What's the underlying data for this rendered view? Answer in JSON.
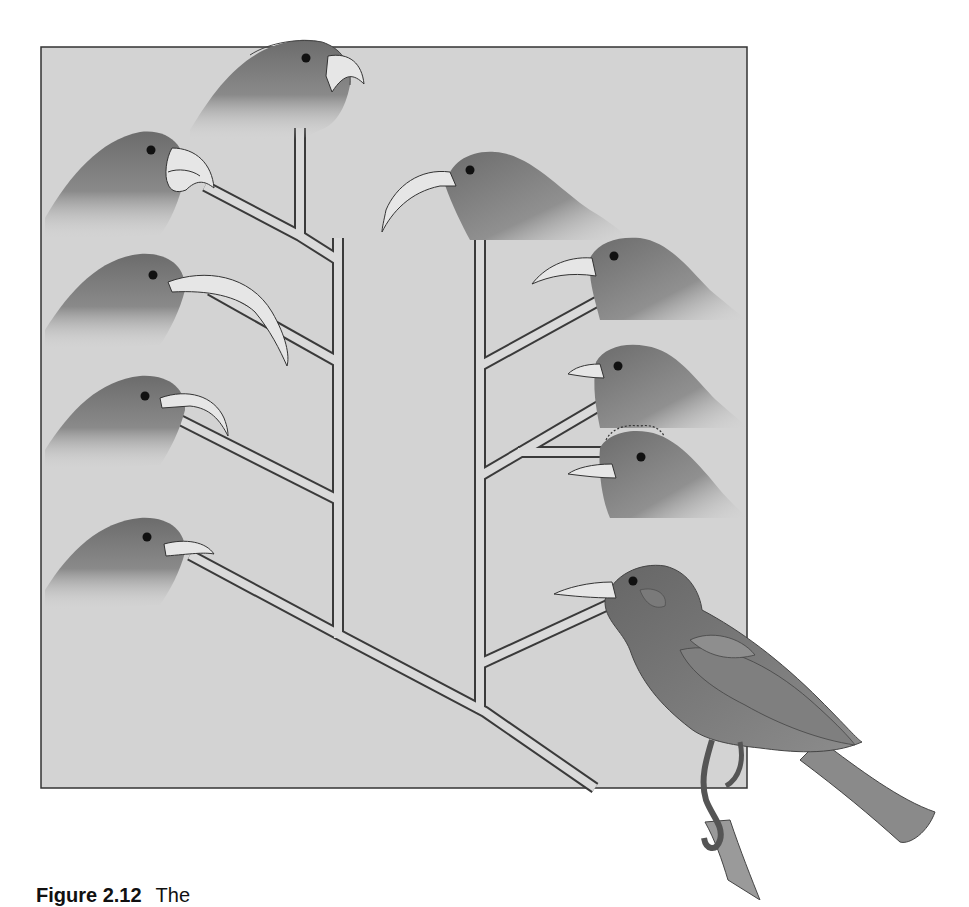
{
  "figure": {
    "colors": {
      "page_background": "#ffffff",
      "panel_background": "#d3d3d3",
      "panel_border": "#333333",
      "bird_body": "#6c6c6c",
      "bird_shade": "#555555",
      "beak": "#e6e6e6",
      "branch_fill": "#dadada",
      "branch_outline": "#3a3a3a"
    },
    "birds": [
      {
        "id": "top-center",
        "beak": "thick-hooked-finch-beak"
      },
      {
        "id": "left-1",
        "beak": "heavy-parrot-beak"
      },
      {
        "id": "left-2",
        "beak": "long-strongly-curved-beak"
      },
      {
        "id": "left-3",
        "beak": "medium-curved-beak"
      },
      {
        "id": "left-4",
        "beak": "short-slightly-curved-beak"
      },
      {
        "id": "right-1",
        "beak": "long-sickle-beak"
      },
      {
        "id": "right-2",
        "beak": "medium-decurved-beak"
      },
      {
        "id": "right-3",
        "beak": "short-straight-beak"
      },
      {
        "id": "right-4",
        "beak": "short-straight-beak-crested"
      },
      {
        "id": "ancestor-perched",
        "beak": "straight-pointed-beak"
      }
    ]
  },
  "caption": {
    "label": "Figure 2.12",
    "text": "The"
  }
}
